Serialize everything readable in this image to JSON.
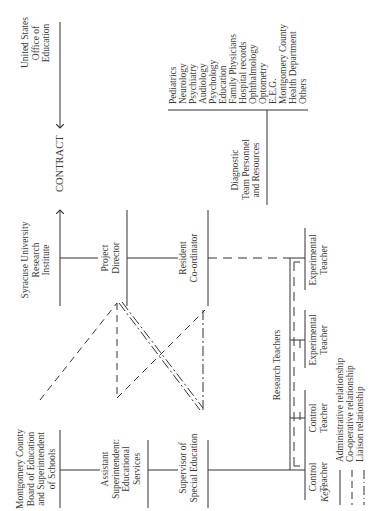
{
  "diagram": {
    "nodes": {
      "usoe": [
        "United States",
        "Office of",
        "Education"
      ],
      "contract": "CONTRACT",
      "syracuse": [
        "Syracuse University",
        "Research",
        "Institute"
      ],
      "project_director": [
        "Project",
        "Director"
      ],
      "resident_coordinator": [
        "Resident",
        "Co-ordinator"
      ],
      "diagnostic": [
        "Diagnostic",
        "Team Personnel",
        "and Resources"
      ],
      "montgomery": [
        "Montgomery County",
        "Board of Education",
        "and Superintendent",
        "of Schools"
      ],
      "asst_supt": [
        "Assistant",
        "Superintendent:",
        "Educational",
        "Services"
      ],
      "supervisor": [
        "Supervisor of",
        "Special Education"
      ],
      "research_teachers": "Research Teachers",
      "teachers": [
        [
          "Control",
          "Teacher"
        ],
        [
          "Control",
          "Teacher"
        ],
        [
          "Experimental",
          "Teacher"
        ],
        [
          "Experimental",
          "Teacher"
        ]
      ]
    },
    "diagnostic_resources": [
      "Pediatrics",
      "Neurology",
      "Psychiatry",
      "Audiology",
      "Psychology",
      "Education",
      "Family Physicians",
      "Hospital records",
      "Ophthalmology",
      "Optometry",
      "E.E.G.",
      "Montgomery County",
      "Health Department",
      "Others"
    ],
    "key": {
      "title": "Key:",
      "items": [
        {
          "style": "solid",
          "label": "Administrative relationship"
        },
        {
          "style": "dashed",
          "label": "Co-operative relationship"
        },
        {
          "style": "dash-dot",
          "label": "Liaison relationship"
        }
      ]
    },
    "colors": {
      "line": "#333333",
      "text": "#3a3a3a",
      "background": "#ffffff"
    }
  }
}
